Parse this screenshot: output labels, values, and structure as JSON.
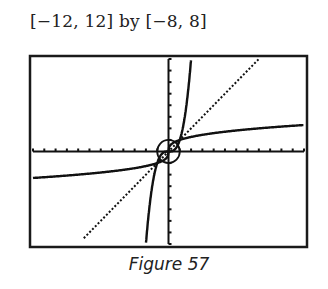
{
  "header": {
    "window_label": "[−12, 12] by [−8, 8]"
  },
  "caption": {
    "text": "Figure 57"
  },
  "chart_data": {
    "type": "line",
    "title": "[−12, 12] by [−8, 8]",
    "caption": "Figure 57",
    "xlabel": "",
    "ylabel": "",
    "xlim": [
      -12,
      12
    ],
    "ylim": [
      -8,
      8
    ],
    "x_tick_step": 1,
    "y_tick_step": 1,
    "grid": false,
    "series": [
      {
        "name": "y = x",
        "style": "dotted",
        "x": [
          -8,
          0,
          8
        ],
        "y": [
          -8,
          0,
          8
        ]
      },
      {
        "name": "y = x^3",
        "style": "steep staircase",
        "x": [
          -2,
          -1,
          0,
          1,
          2
        ],
        "y": [
          -8,
          -1,
          0,
          1,
          8
        ]
      },
      {
        "name": "y = x^(1/3)",
        "style": "flat staircase",
        "x": [
          -12,
          -8,
          -1,
          0,
          1,
          8,
          12
        ],
        "y": [
          -2.29,
          -2,
          -1,
          0,
          1,
          2,
          2.29
        ]
      },
      {
        "name": "unit circle",
        "style": "small circle",
        "center": [
          0,
          0
        ],
        "radius": 1
      }
    ]
  }
}
